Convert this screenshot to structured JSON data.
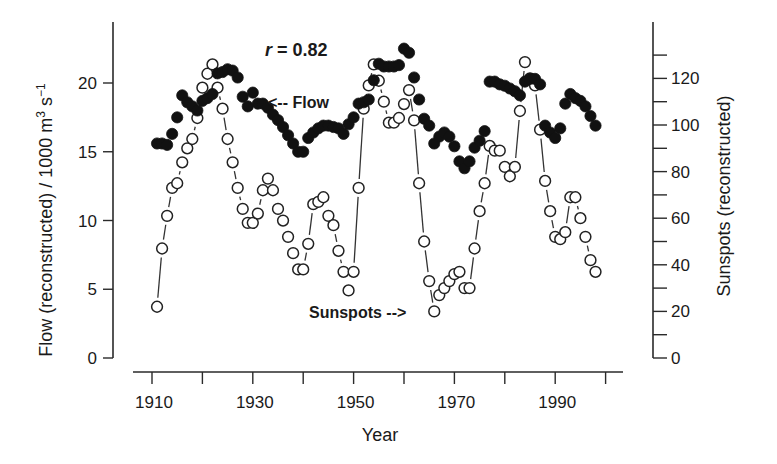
{
  "chart_data": {
    "type": "scatter",
    "title": "",
    "xlabel": "Year",
    "ylabel_left": "Flow (reconstructed) / 1000 m³ s⁻¹",
    "ylabel_right": "Sunspots (reconstructed)",
    "xlim": [
      1905,
      2004
    ],
    "ylim_left": [
      0,
      24
    ],
    "ylim_right": [
      0,
      140
    ],
    "x_ticks_major": [
      1910,
      1930,
      1950,
      1970,
      1990
    ],
    "x_ticks_minor": [
      1920,
      1940,
      1960,
      1980,
      2000
    ],
    "y_ticks_left": [
      0,
      5,
      10,
      15,
      20
    ],
    "y_ticks_right_major": [
      0,
      20,
      40,
      60,
      80,
      100,
      120
    ],
    "y_ticks_right_minor": [
      10,
      30,
      50,
      70,
      90,
      110,
      130
    ],
    "grid": false,
    "legend": "none (inline annotations)",
    "annotations": [
      {
        "text": "r = 0.82",
        "italic_part": "r",
        "position": "top-center"
      },
      {
        "text": "<-- Flow",
        "points_to": "flow series near 1930"
      },
      {
        "text": "Sunspots -->",
        "points_to": "sunspot series near 1966"
      }
    ],
    "series": [
      {
        "name": "Flow",
        "axis": "left",
        "marker": "filled-circle",
        "x": [
          1911,
          1912,
          1913,
          1914,
          1915,
          1916,
          1917,
          1918,
          1919,
          1920,
          1921,
          1922,
          1923,
          1924,
          1925,
          1926,
          1927,
          1928,
          1929,
          1930,
          1931,
          1932,
          1933,
          1934,
          1935,
          1936,
          1937,
          1938,
          1939,
          1940,
          1941,
          1942,
          1943,
          1944,
          1945,
          1946,
          1947,
          1948,
          1949,
          1950,
          1951,
          1952,
          1953,
          1954,
          1955,
          1956,
          1957,
          1958,
          1959,
          1960,
          1961,
          1962,
          1963,
          1964,
          1965,
          1966,
          1967,
          1968,
          1969,
          1970,
          1971,
          1972,
          1973,
          1974,
          1975,
          1976,
          1977,
          1978,
          1979,
          1980,
          1981,
          1982,
          1983,
          1984,
          1985,
          1986,
          1987,
          1988,
          1989,
          1990,
          1991,
          1992,
          1993,
          1994,
          1995,
          1996,
          1997,
          1998
        ],
        "values": [
          15.6,
          15.6,
          15.5,
          16.3,
          17.5,
          19.1,
          18.6,
          18.3,
          18.0,
          18.7,
          18.9,
          19.2,
          20.7,
          20.8,
          21.0,
          20.9,
          20.4,
          19.0,
          18.3,
          19.3,
          18.5,
          18.5,
          18.2,
          17.7,
          17.3,
          16.8,
          16.2,
          15.6,
          15.0,
          15.0,
          16.0,
          16.4,
          16.7,
          16.9,
          16.9,
          16.8,
          16.7,
          16.3,
          17.0,
          17.5,
          18.5,
          18.6,
          18.8,
          20.2,
          21.4,
          21.2,
          21.2,
          21.2,
          21.3,
          22.5,
          22.2,
          20.4,
          18.8,
          17.4,
          16.9,
          15.6,
          16.1,
          16.4,
          16.1,
          15.4,
          14.3,
          13.8,
          14.3,
          15.3,
          15.8,
          16.5,
          20.1,
          20.1,
          19.9,
          19.8,
          19.6,
          19.4,
          19.1,
          20.1,
          20.3,
          20.3,
          19.9,
          16.9,
          16.4,
          16.0,
          16.7,
          18.5,
          19.2,
          18.9,
          18.7,
          18.3,
          17.6,
          16.9
        ]
      },
      {
        "name": "Sunspots",
        "axis": "right",
        "marker": "open-circle",
        "x": [
          1911,
          1912,
          1913,
          1914,
          1915,
          1916,
          1917,
          1918,
          1919,
          1920,
          1921,
          1922,
          1923,
          1924,
          1925,
          1926,
          1927,
          1928,
          1929,
          1930,
          1931,
          1932,
          1933,
          1934,
          1935,
          1936,
          1937,
          1938,
          1939,
          1940,
          1941,
          1942,
          1943,
          1944,
          1945,
          1946,
          1947,
          1948,
          1949,
          1950,
          1951,
          1952,
          1953,
          1954,
          1955,
          1956,
          1957,
          1958,
          1959,
          1960,
          1961,
          1962,
          1963,
          1964,
          1965,
          1966,
          1967,
          1968,
          1969,
          1970,
          1971,
          1972,
          1973,
          1974,
          1975,
          1976,
          1977,
          1978,
          1979,
          1980,
          1981,
          1982,
          1983,
          1984,
          1985,
          1986,
          1987,
          1988,
          1989,
          1990,
          1991,
          1992,
          1993,
          1994,
          1995,
          1996,
          1997,
          1998
        ],
        "values": [
          22,
          47,
          61,
          73,
          75,
          84,
          90,
          94,
          103,
          116,
          122,
          126,
          116,
          107,
          94,
          84,
          73,
          64,
          58,
          58,
          62,
          72,
          77,
          72,
          64,
          59,
          52,
          45,
          38,
          38,
          49,
          66,
          67,
          69,
          61,
          57,
          46,
          37,
          29,
          37,
          73,
          107,
          117,
          126,
          119,
          110,
          101,
          101,
          103,
          109,
          115,
          102,
          75,
          50,
          33,
          20,
          27,
          30,
          33,
          36,
          37,
          30,
          30,
          47,
          63,
          75,
          91,
          89,
          89,
          82,
          78,
          82,
          106,
          127,
          120,
          117,
          98,
          76,
          63,
          52,
          51,
          54,
          69,
          69,
          60,
          52,
          42,
          37
        ]
      }
    ]
  },
  "annotations": {
    "r_symbol": "r",
    "r_value": " = 0.82",
    "flow_label": "<-- Flow",
    "sunspots_label": "Sunspots -->"
  },
  "axes": {
    "x_title": "Year",
    "left_title_main": "Flow (reconstructed) / 1000 m",
    "left_title_sup1": "3",
    "left_title_mid": " s",
    "left_title_sup2": "−1",
    "right_title": "Sunspots (reconstructed)"
  }
}
